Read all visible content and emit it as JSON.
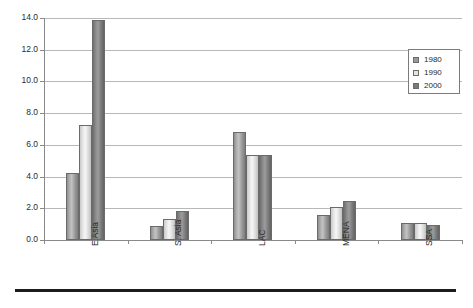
{
  "chart_data": {
    "type": "bar",
    "title": "",
    "subtitle": "",
    "xlabel": "",
    "ylabel": "",
    "categories": [
      "E Asia",
      "S. Asia",
      "LAC",
      "MENA",
      "SSA"
    ],
    "series": [
      {
        "name": "1980",
        "color": "#9a9a9a",
        "values": [
          4.2,
          0.9,
          6.8,
          1.6,
          1.1
        ]
      },
      {
        "name": "1990",
        "color": "#e4e4e4",
        "values": [
          7.25,
          1.35,
          5.35,
          2.1,
          1.1
        ]
      },
      {
        "name": "2000",
        "color": "#7a7a7a",
        "values": [
          13.85,
          1.8,
          5.35,
          2.45,
          0.95
        ]
      }
    ],
    "ylim": [
      0.0,
      14.0
    ],
    "ytick_labels": [
      "0.0",
      "2.0",
      "4.0",
      "6.0",
      "8.0",
      "10.0",
      "12.0",
      "14.0"
    ],
    "ytick_values": [
      0.0,
      2.0,
      4.0,
      6.0,
      8.0,
      10.0,
      12.0,
      14.0
    ],
    "grid": true,
    "grid_axis": "y",
    "legend_position": "top-right",
    "legend_entries": [
      "1980",
      "1990",
      "2000"
    ]
  },
  "figure": {
    "bottom_rule": ""
  }
}
